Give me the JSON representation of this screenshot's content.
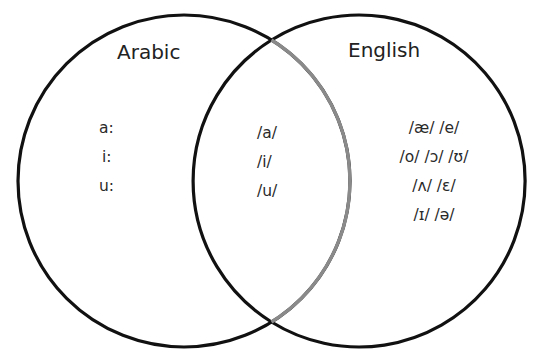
{
  "diagram": {
    "type": "venn",
    "sets": [
      {
        "id": "arabic",
        "label": "Arabic",
        "only_items": [
          "a:",
          "i:",
          "u:"
        ]
      },
      {
        "id": "english",
        "label": "English",
        "only_items": [
          "/æ/ /e/",
          "/o/ /ɔ/ /ʊ/",
          "/ʌ/ /ɛ/",
          "/ɪ/ /ə/"
        ]
      }
    ],
    "intersection": {
      "items": [
        "/a/",
        "/i/",
        "/u/"
      ]
    },
    "colors": {
      "circle_stroke": "#111111",
      "inner_arc_stroke": "#8a8a8a",
      "background": "#ffffff"
    }
  }
}
